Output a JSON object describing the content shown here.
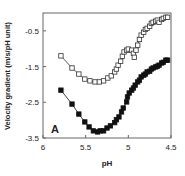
{
  "chart_data": {
    "type": "scatter",
    "panel_label": "A",
    "title": "",
    "xlabel": "pH",
    "ylabel": "Velocity gradient (m/s/pH unit)",
    "xlim": [
      6,
      4.5
    ],
    "ylim": [
      -3.5,
      0.0
    ],
    "x_reversed": true,
    "xticks": [
      6,
      5.5,
      5,
      4.5
    ],
    "xtick_labels": [
      "6",
      "5.5",
      "5",
      "4.5"
    ],
    "yticks": [
      -0.5,
      -1.5,
      -2.5,
      -3.5
    ],
    "ytick_labels": [
      "-0.5",
      "-1.5",
      "-2.5",
      "-3.5"
    ],
    "grid": false,
    "legend": null,
    "series": [
      {
        "name": "open squares",
        "marker": "open-square",
        "color": "#333333",
        "x": [
          5.79,
          5.66,
          5.58,
          5.51,
          5.45,
          5.39,
          5.34,
          5.29,
          5.24,
          5.2,
          5.16,
          5.14,
          5.12,
          5.09,
          5.07,
          5.05,
          5.02,
          5.0,
          4.96,
          4.94,
          4.93,
          4.91,
          4.89,
          4.87,
          4.85,
          4.82,
          4.8,
          4.78,
          4.75,
          4.73,
          4.71,
          4.68,
          4.66,
          4.64,
          4.61,
          4.59,
          4.56,
          4.54
        ],
        "y": [
          -1.2,
          -1.54,
          -1.71,
          -1.85,
          -1.9,
          -1.93,
          -1.93,
          -1.9,
          -1.82,
          -1.76,
          -1.65,
          -1.57,
          -1.46,
          -1.35,
          -1.21,
          -1.09,
          -1.04,
          -1.01,
          -1.04,
          -1.13,
          -1.24,
          -1.04,
          -0.9,
          -0.74,
          -0.62,
          -0.54,
          -0.46,
          -0.43,
          -0.37,
          -0.29,
          -0.26,
          -0.23,
          -0.2,
          -0.26,
          -0.18,
          -0.15,
          -0.12,
          -0.12
        ]
      },
      {
        "name": "filled squares",
        "marker": "filled-square",
        "color": "#111111",
        "x": [
          5.79,
          5.66,
          5.58,
          5.51,
          5.46,
          5.41,
          5.36,
          5.33,
          5.29,
          5.25,
          5.21,
          5.16,
          5.14,
          5.11,
          5.08,
          5.06,
          5.02,
          5.01,
          4.99,
          4.96,
          4.94,
          4.92,
          4.89,
          4.87,
          4.85,
          4.82,
          4.8,
          4.78,
          4.75,
          4.73,
          4.71,
          4.68,
          4.66,
          4.64,
          4.61,
          4.59,
          4.56,
          4.54
        ],
        "y": [
          -2.16,
          -2.55,
          -2.83,
          -3.05,
          -3.19,
          -3.3,
          -3.33,
          -3.3,
          -3.3,
          -3.22,
          -3.16,
          -3.07,
          -2.99,
          -2.91,
          -2.77,
          -2.66,
          -2.49,
          -2.35,
          -2.24,
          -2.16,
          -2.1,
          -2.02,
          -1.93,
          -1.88,
          -1.79,
          -1.74,
          -1.71,
          -1.65,
          -1.63,
          -1.57,
          -1.54,
          -1.51,
          -1.49,
          -1.46,
          -1.4,
          -1.38,
          -1.32,
          -1.32
        ]
      }
    ]
  }
}
